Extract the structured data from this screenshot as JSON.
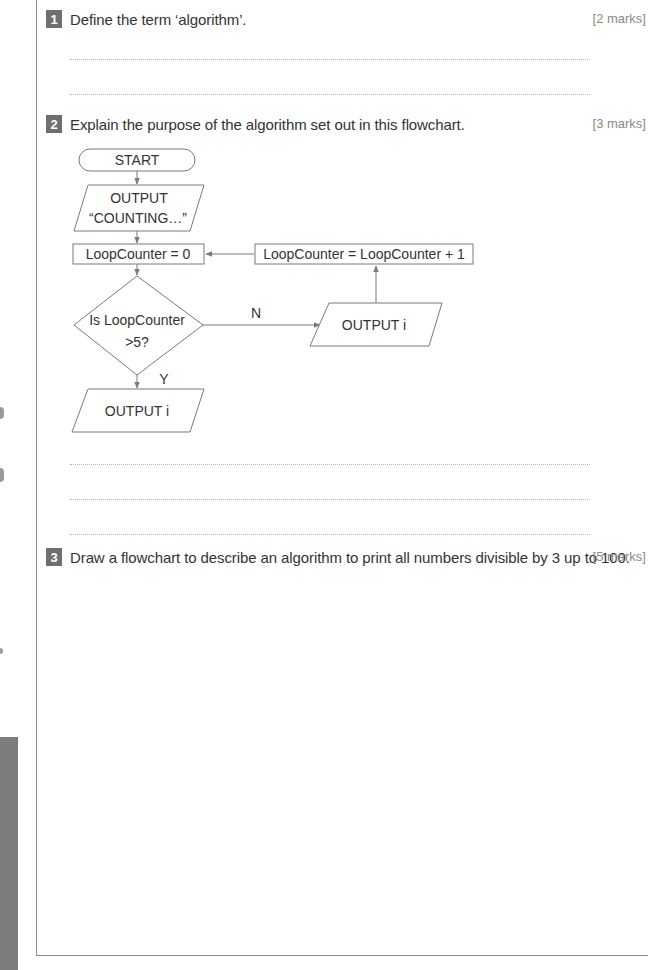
{
  "questions": [
    {
      "number": "1",
      "text": "Define the term ‘algorithm’.",
      "marks": "[2 marks]",
      "answer_lines": 2
    },
    {
      "number": "2",
      "text": "Explain the purpose of the algorithm set out in this flowchart.",
      "marks": "[3 marks]",
      "answer_lines": 3
    },
    {
      "number": "3",
      "text": "Draw a flowchart to describe an algorithm to print all numbers divisible by 3 up to 100.",
      "marks": "[5 marks]",
      "answer_lines": 0
    }
  ],
  "flowchart": {
    "start": "START",
    "output_line1": "OUTPUT",
    "output_line2": "“COUNTING…”",
    "init": "LoopCounter = 0",
    "decision_line1": "Is LoopCounter",
    "decision_line2": ">5?",
    "no_label": "N",
    "yes_label": "Y",
    "output_loop": "OUTPUT i",
    "increment": "LoopCounter = LoopCounter + 1",
    "output_end": "OUTPUT i"
  },
  "colors": {
    "frame": "#8a8a8a",
    "qnum_bg": "#6f6f6f",
    "shape_stroke": "#7a7a7a",
    "text": "#333333",
    "marks": "#8a8a8a"
  }
}
